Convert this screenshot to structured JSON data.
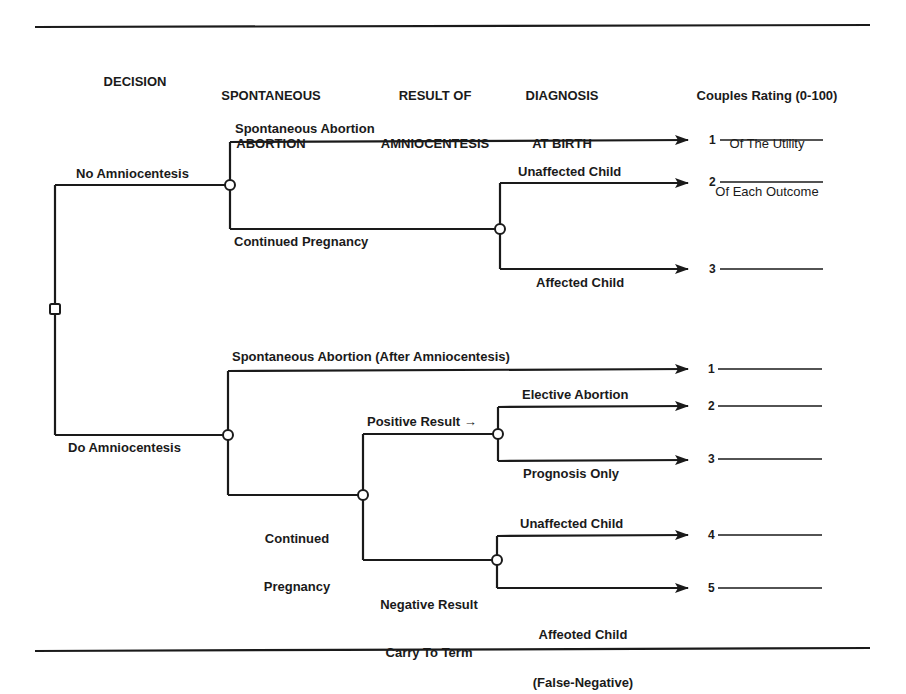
{
  "headers": {
    "decision": "DECISION",
    "spontaneous_abortion": [
      "SPONTANEOUS",
      "ABORTION"
    ],
    "result_of_amniocentesis": [
      "RESULT OF",
      "AMNIOCENTESIS"
    ],
    "diagnosis_at_birth": [
      "DIAGNOSIS",
      "AT BIRTH"
    ],
    "utility_rating": [
      "Couples Rating (0-100)",
      "Of The Utility",
      "Of Each Outcome"
    ]
  },
  "tree": {
    "root": {
      "type": "decision",
      "shape": "square"
    },
    "branches": [
      {
        "label": "No Amniocentesis",
        "chance_node": {
          "outcomes": [
            {
              "label": "Spontaneous Abortion",
              "outcome_number": "1"
            },
            {
              "label": "Continued Pregnancy",
              "chance_node": {
                "outcomes": [
                  {
                    "label": "Unaffected Child",
                    "outcome_number": "2"
                  },
                  {
                    "label": "Affected Child",
                    "outcome_number": "3"
                  }
                ]
              }
            }
          ]
        }
      },
      {
        "label": "Do Amniocentesis",
        "chance_node": {
          "outcomes": [
            {
              "label": "Spontaneous Abortion (After Amniocentesis)",
              "outcome_number": "1"
            },
            {
              "label": "Continued Pregnancy",
              "chance_node": {
                "outcomes": [
                  {
                    "label": "Positive Result →",
                    "choice_node": {
                      "outcomes": [
                        {
                          "label": "Elective Abortion",
                          "outcome_number": "2"
                        },
                        {
                          "label": "Prognosis Only",
                          "outcome_number": "3"
                        }
                      ]
                    }
                  },
                  {
                    "label": "Negative Result Carry To Term",
                    "chance_node": {
                      "outcomes": [
                        {
                          "label": "Unaffected Child",
                          "outcome_number": "4"
                        },
                        {
                          "label": "Affeoted Child (False-Negative)",
                          "outcome_number": "5"
                        }
                      ]
                    }
                  }
                ]
              }
            }
          ]
        }
      }
    ]
  },
  "labels": {
    "no_amnio": "No Amniocentesis",
    "do_amnio": "Do Amniocentesis",
    "na_spont": "Spontaneous Abortion",
    "na_continued": "Continued Pregnancy",
    "na_unaffected": "Unaffected Child",
    "na_affected": "Affected Child",
    "da_spont": "Spontaneous Abortion (After Amniocentesis)",
    "da_continued": [
      "Continued",
      "Pregnancy"
    ],
    "da_positive": "Positive Result →",
    "da_negative": [
      "Negative Result",
      "Carry To Term"
    ],
    "da_elective": "Elective Abortion",
    "da_prognosis": "Prognosis Only",
    "da_unaffected": "Unaffected Child",
    "da_affected": [
      "Affeoted Child",
      "(False-Negative)"
    ]
  },
  "outcome_numbers": {
    "na": [
      "1",
      "2",
      "3"
    ],
    "da": [
      "1",
      "2",
      "3",
      "4",
      "5"
    ]
  },
  "colors": {
    "ink": "#1a1a1a",
    "background": "#ffffff"
  }
}
